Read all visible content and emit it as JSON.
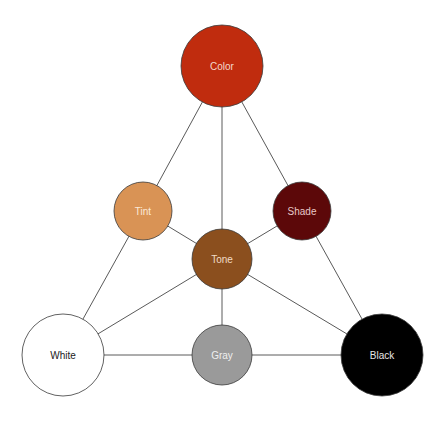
{
  "diagram": {
    "type": "color-triangle",
    "nodes": [
      {
        "id": "color",
        "label": "Color",
        "cx": 222,
        "cy": 66,
        "r": 41,
        "fill": "#c02c0e",
        "text_color": "#f3d9cc",
        "stroke": "#7a2010"
      },
      {
        "id": "tint",
        "label": "Tint",
        "cx": 143,
        "cy": 211,
        "r": 29,
        "fill": "#d99355",
        "text_color": "#fbe9d7",
        "stroke": "#6b4420"
      },
      {
        "id": "shade",
        "label": "Shade",
        "cx": 302,
        "cy": 211,
        "r": 29,
        "fill": "#5c0809",
        "text_color": "#e8c8c8",
        "stroke": "#3a0505"
      },
      {
        "id": "tone",
        "label": "Tone",
        "cx": 222,
        "cy": 259,
        "r": 30,
        "fill": "#8b4f1e",
        "text_color": "#f1dcc6",
        "stroke": "#4a2a10"
      },
      {
        "id": "white",
        "label": "White",
        "cx": 63,
        "cy": 355,
        "r": 41,
        "fill": "#ffffff",
        "text_color": "#222222",
        "stroke": "#555555"
      },
      {
        "id": "gray",
        "label": "Gray",
        "cx": 222,
        "cy": 355,
        "r": 30,
        "fill": "#9a9a9a",
        "text_color": "#efefef",
        "stroke": "#4a4a4a"
      },
      {
        "id": "black",
        "label": "Black",
        "cx": 382,
        "cy": 355,
        "r": 41,
        "fill": "#000000",
        "text_color": "#e6e6e6",
        "stroke": "#000000"
      }
    ],
    "edges": [
      {
        "from": "color",
        "to": "tint"
      },
      {
        "from": "color",
        "to": "tone"
      },
      {
        "from": "color",
        "to": "shade"
      },
      {
        "from": "tint",
        "to": "white"
      },
      {
        "from": "tint",
        "to": "tone"
      },
      {
        "from": "shade",
        "to": "black"
      },
      {
        "from": "shade",
        "to": "tone"
      },
      {
        "from": "tone",
        "to": "white"
      },
      {
        "from": "tone",
        "to": "gray"
      },
      {
        "from": "tone",
        "to": "black"
      },
      {
        "from": "white",
        "to": "gray"
      },
      {
        "from": "gray",
        "to": "black"
      }
    ],
    "edge_color": "#5a5a5a"
  }
}
